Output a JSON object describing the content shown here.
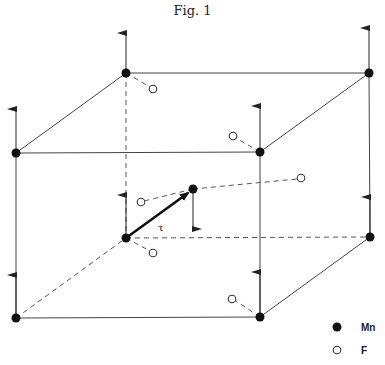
{
  "figure": {
    "title": "Fig. 1",
    "vector_label": "τ"
  },
  "legend": [
    {
      "symbol": "filled-circle",
      "label": "Mn"
    },
    {
      "symbol": "open-circle",
      "label": "F"
    }
  ],
  "atoms": {
    "mn_corner_count": 8,
    "mn_center_count": 1,
    "f_count": 6
  },
  "spins": {
    "corner_direction": "up",
    "center_direction": "down"
  },
  "colors": {
    "line": "#444444",
    "mn_fill": "#111111",
    "f_fill": "#ffffff",
    "background": "#ffffff"
  }
}
